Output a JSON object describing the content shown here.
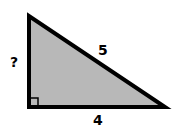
{
  "diagram": {
    "type": "right-triangle",
    "labels": {
      "vertical_leg": "?",
      "hypotenuse": "5",
      "horizontal_leg": "4"
    },
    "colors": {
      "fill": "#b8b8b8",
      "stroke": "#000000",
      "background": "#ffffff"
    }
  }
}
